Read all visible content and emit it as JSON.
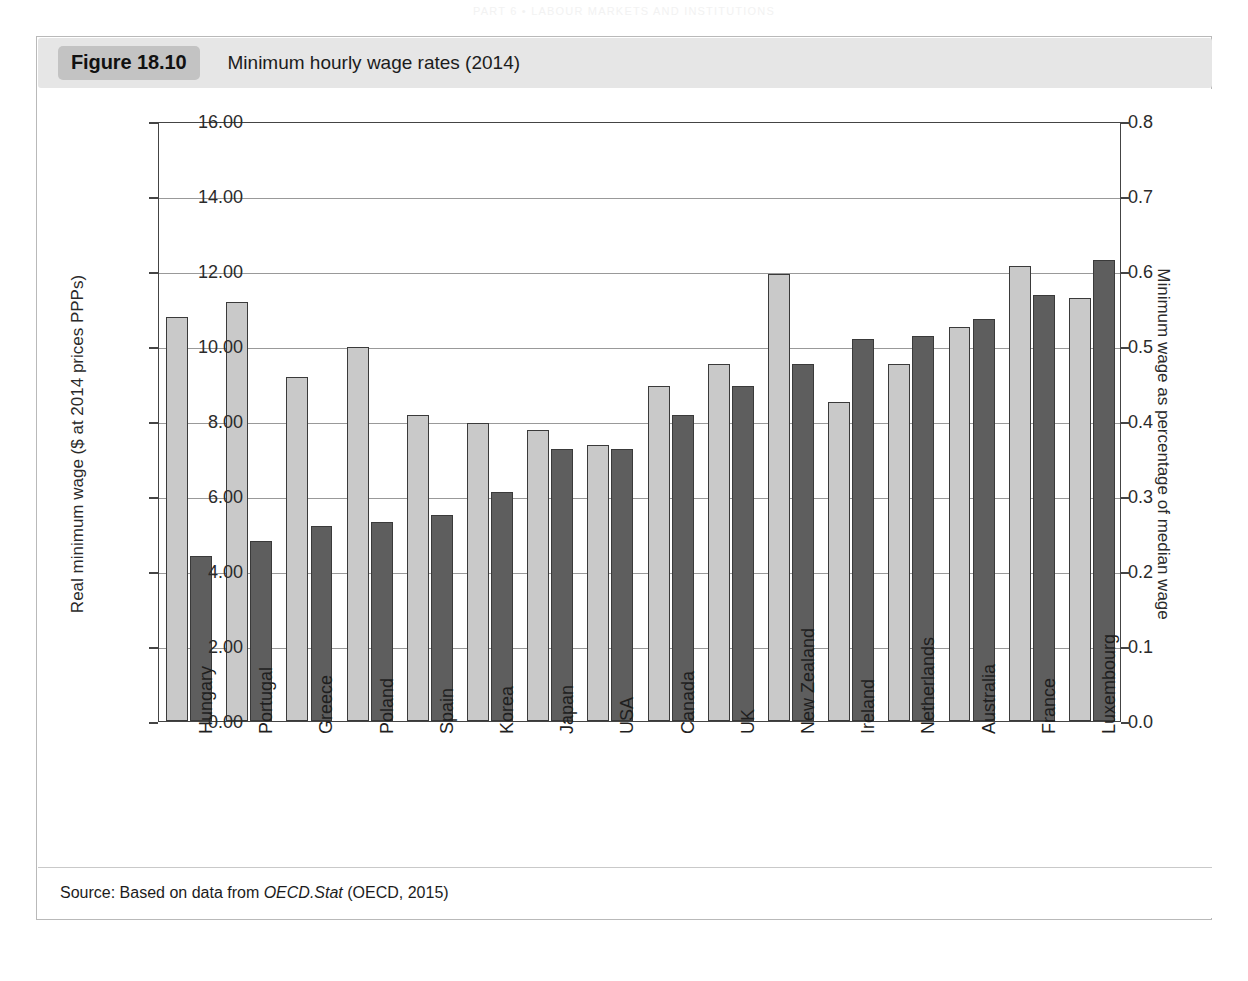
{
  "page": {
    "running_head": "PART 6  •  LABOUR MARKETS AND INSTITUTIONS"
  },
  "figure": {
    "number_label": "Figure 18.10",
    "title": "Minimum hourly wage rates (2014)",
    "source_prefix": "Source: Based on data from ",
    "source_italic": "OECD.Stat",
    "source_suffix": " (OECD, 2015)"
  },
  "colors": {
    "series_light": "#c9c9c9",
    "series_dark": "#5e5e5e",
    "caption_band": "#e6e6e6",
    "figure_badge": "#c3c3c3",
    "gridline": "#999999",
    "axis": "#444444"
  },
  "chart_data": {
    "type": "bar",
    "title": "Minimum hourly wage rates (2014)",
    "xlabel": "",
    "ylabel": "Real minimum wage ($ at 2014 prices PPPs)",
    "y2label": "Minimum wage as percentage of median wage",
    "ylim": [
      0,
      16
    ],
    "y2lim": [
      0,
      0.8
    ],
    "yticks": [
      "0.00",
      "2.00",
      "4.00",
      "6.00",
      "8.00",
      "10.00",
      "12.00",
      "14.00",
      "16.00"
    ],
    "ytick_values": [
      0,
      2,
      4,
      6,
      8,
      10,
      12,
      14,
      16
    ],
    "y2ticks": [
      "0.0",
      "0.1",
      "0.2",
      "0.3",
      "0.4",
      "0.5",
      "0.6",
      "0.7",
      "0.8"
    ],
    "y2tick_values": [
      0,
      0.1,
      0.2,
      0.3,
      0.4,
      0.5,
      0.6,
      0.7,
      0.8
    ],
    "grid": true,
    "legend": null,
    "categories": [
      "Hungary",
      "Portugal",
      "Greece",
      "Poland",
      "Spain",
      "Korea",
      "Japan",
      "USA",
      "Canada",
      "UK",
      "New Zealand",
      "Ireland",
      "Netherlands",
      "Australia",
      "France",
      "Luxembourg"
    ],
    "series": [
      {
        "name": "Real minimum wage ($ at 2014 prices PPPs)",
        "axis": "left",
        "color": "#c9c9c9",
        "values": [
          10.78,
          11.17,
          9.18,
          9.98,
          8.17,
          7.96,
          7.76,
          7.36,
          8.93,
          9.52,
          11.92,
          8.5,
          9.52,
          10.5,
          12.13,
          11.29
        ]
      },
      {
        "name": "Minimum wage as percentage of median wage",
        "axis": "right",
        "color": "#5e5e5e",
        "values": [
          0.22,
          0.24,
          0.26,
          0.265,
          0.275,
          0.305,
          0.3625,
          0.3625,
          0.4075,
          0.4465,
          0.4765,
          0.51,
          0.5135,
          0.5355,
          0.5685,
          0.615
        ]
      }
    ],
    "series_right_as_left_scale": [
      4.4,
      4.8,
      5.2,
      5.3,
      5.5,
      6.1,
      7.25,
      7.25,
      8.15,
      8.93,
      9.53,
      10.2,
      10.27,
      10.71,
      11.37,
      12.3
    ]
  }
}
